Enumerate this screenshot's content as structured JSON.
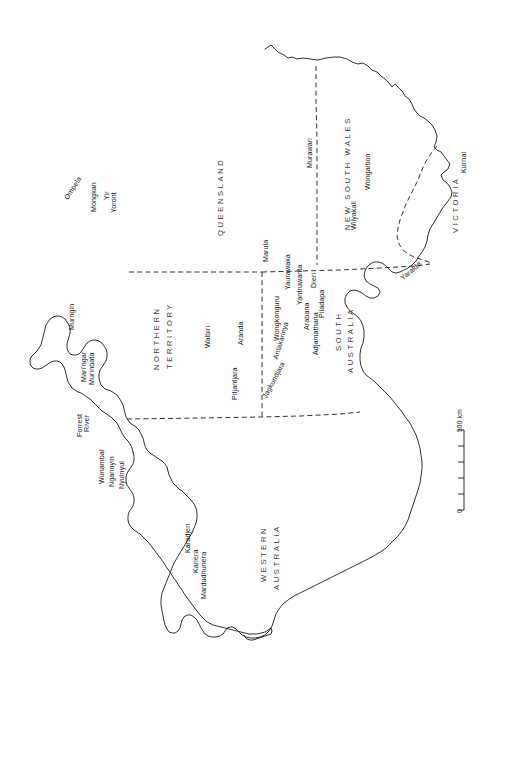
{
  "document": {
    "type": "map",
    "subject": "Australia — Aboriginal tribal groups and state boundaries",
    "orientation_note": "Map printed sideways; all labels read bottom-to-top",
    "background_color": "#ffffff",
    "ink_color": "#1a1a1a"
  },
  "states": [
    {
      "id": "queensland",
      "name": "QUEENSLAND"
    },
    {
      "id": "new-south-wales",
      "name": "NEW SOUTH WALES"
    },
    {
      "id": "victoria",
      "name": "VICTORIA"
    },
    {
      "id": "south-australia-1",
      "name": "SOUTH"
    },
    {
      "id": "south-australia-2",
      "name": "AUSTRALIA"
    },
    {
      "id": "northern-territory-1",
      "name": "NORTHERN"
    },
    {
      "id": "northern-territory-2",
      "name": "TERRITORY"
    },
    {
      "id": "western-australia-1",
      "name": "WESTERN"
    },
    {
      "id": "western-australia-2",
      "name": "AUSTRALIA"
    }
  ],
  "tribes": [
    {
      "id": "ompela",
      "name": "Ompela"
    },
    {
      "id": "mongkan",
      "name": "Mongkan"
    },
    {
      "id": "yir-yoront-1",
      "name": "Yir"
    },
    {
      "id": "yir-yoront-2",
      "name": "Yoront"
    },
    {
      "id": "murngin",
      "name": "Murngin"
    },
    {
      "id": "maringar",
      "name": "Mari'ngar"
    },
    {
      "id": "murinbata",
      "name": "Murinbata"
    },
    {
      "id": "forrest-river-1",
      "name": "Forrest"
    },
    {
      "id": "forrest-river-2",
      "name": "River"
    },
    {
      "id": "wunambal",
      "name": "Wunambal"
    },
    {
      "id": "ngarinyin",
      "name": "Ngarinyin"
    },
    {
      "id": "nyulnyul",
      "name": "Nyulnyul"
    },
    {
      "id": "karadjeri",
      "name": "Karadjeri"
    },
    {
      "id": "kariera",
      "name": "Kariera"
    },
    {
      "id": "mardudhunera",
      "name": "Mardudhunera"
    },
    {
      "id": "walbiri",
      "name": "Walbiri"
    },
    {
      "id": "aranda",
      "name": "Aranda"
    },
    {
      "id": "pitjantjara",
      "name": "Pitjantjara"
    },
    {
      "id": "antakarinya",
      "name": "Antakarinya"
    },
    {
      "id": "jagkundjara",
      "name": "Jagkundjara"
    },
    {
      "id": "wongkonguru",
      "name": "Wongkonguru"
    },
    {
      "id": "yaurawaka",
      "name": "Yaurawaka"
    },
    {
      "id": "marula",
      "name": "Marula"
    },
    {
      "id": "yantruwanta",
      "name": "Yantruwanta"
    },
    {
      "id": "dieri",
      "name": "Dieri"
    },
    {
      "id": "piladapa",
      "name": "Piladapa"
    },
    {
      "id": "arabana",
      "name": "Arabana"
    },
    {
      "id": "adjamathana",
      "name": "Adjamathana"
    },
    {
      "id": "murawari",
      "name": "Murawari"
    },
    {
      "id": "wongaibon",
      "name": "Wongaibon"
    },
    {
      "id": "wilyakali",
      "name": "Wilyakali"
    },
    {
      "id": "kurnai",
      "name": "Kurnai"
    },
    {
      "id": "yaralde",
      "name": "Yaralde"
    }
  ],
  "scale_bar": {
    "max_label": "500 km",
    "min_label": "0",
    "tick_count": 5
  }
}
